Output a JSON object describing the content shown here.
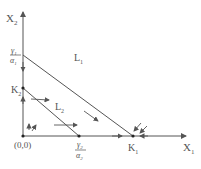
{
  "diagram": {
    "axes": {
      "x_label": "X",
      "x_sub": "1",
      "y_label": "X",
      "y_sub": "2",
      "origin_label": "(0,0)"
    },
    "points": {
      "k1": {
        "label": "K",
        "sub": "1"
      },
      "k2": {
        "label": "K",
        "sub": "2"
      },
      "y_intercept_L1": {
        "num": "γ",
        "num_sub": "1",
        "den": "α",
        "den_sub": "1"
      },
      "x_intercept_L2": {
        "num": "γ",
        "num_sub": "2",
        "den": "α",
        "den_sub": "2"
      }
    },
    "lines": {
      "L1": {
        "label": "L",
        "sub": "1"
      },
      "L2": {
        "label": "L",
        "sub": "2"
      }
    },
    "colors": {
      "stroke": "#555555",
      "dot": "#222222"
    }
  }
}
